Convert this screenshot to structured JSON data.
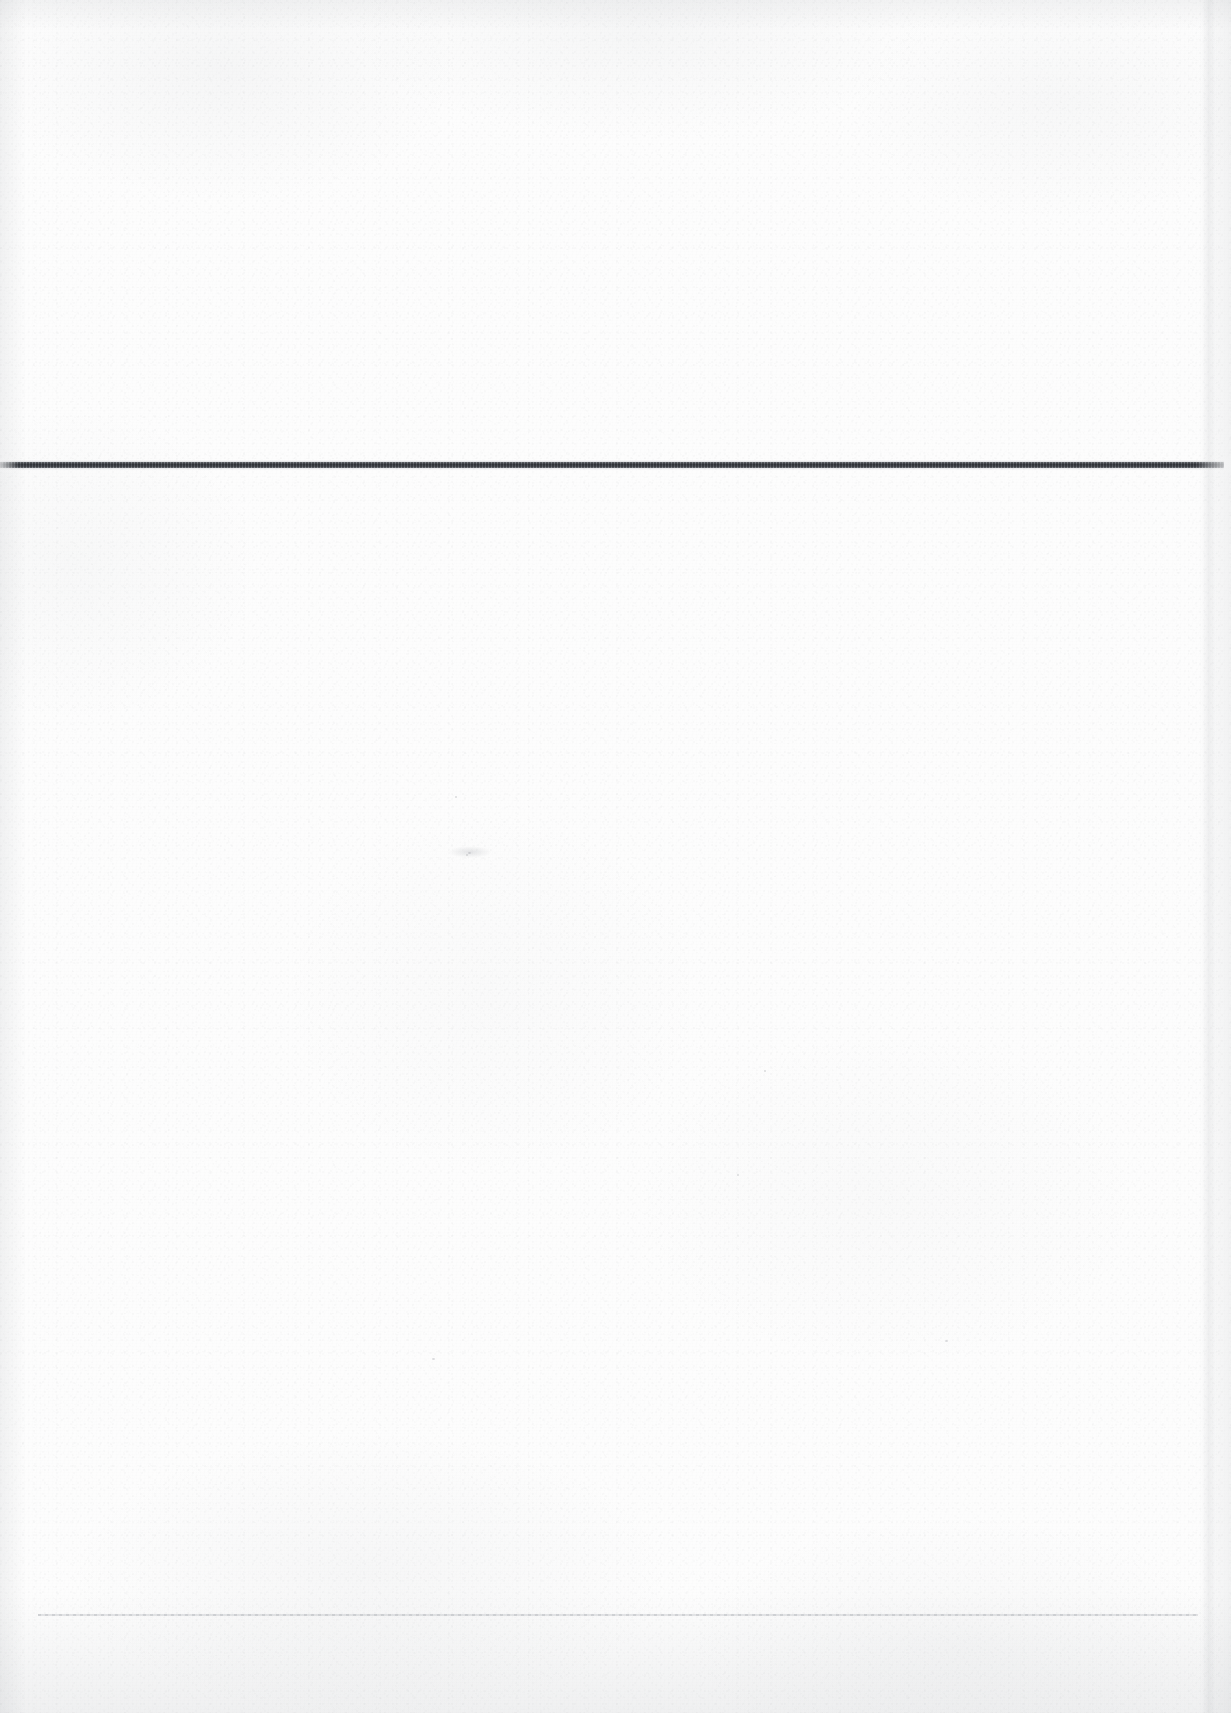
{
  "document": {
    "kind": "scanned-blank-page",
    "page_label": "",
    "body_text": "",
    "width_px": 1231,
    "height_px": 1713,
    "background_color": "#fdfdfd",
    "paper_tone": "#fafafa"
  },
  "marks": {
    "primary_rule": {
      "name": "horizontal-rule",
      "label": "",
      "color": "#6a6e74",
      "x": 0,
      "y": 462,
      "width": 1224,
      "height": 6
    },
    "secondary_rule": {
      "name": "faint-horizontal-rule",
      "label": "",
      "color": "#9ca0a6",
      "x": 38,
      "y": 1614,
      "width": 1160,
      "height": 2
    }
  },
  "artifacts": {
    "edge_seam_color": "#858a91",
    "vignette_color": "#828790",
    "grain_color": "#787d82"
  }
}
